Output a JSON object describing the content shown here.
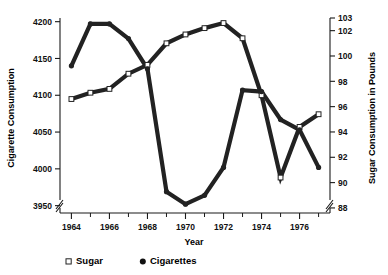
{
  "chart_data": {
    "type": "line",
    "title": "",
    "xlabel": "Year",
    "ylabel": "Cigarette Consumption",
    "ylabel_right": "Sugar Consumption in Pounds",
    "x": [
      1964,
      1965,
      1966,
      1967,
      1968,
      1969,
      1970,
      1971,
      1972,
      1973,
      1974,
      1975,
      1976,
      1977
    ],
    "xlim": [
      1963.4,
      1977.6
    ],
    "xticks_major": [
      1964,
      1966,
      1968,
      1970,
      1972,
      1974,
      1976
    ],
    "xticks_minor": [
      1965,
      1967,
      1969,
      1971,
      1973,
      1975,
      1977
    ],
    "xticklabels": [
      "1964",
      "1966",
      "1968",
      "1970",
      "1972",
      "1974",
      "1976"
    ],
    "ylim": [
      3940,
      4205
    ],
    "yticks": [
      3950,
      4000,
      4050,
      4100,
      4150,
      4200
    ],
    "yticklabels": [
      "3950",
      "4000",
      "4050",
      "4100",
      "4150",
      "4200"
    ],
    "ylim_right": [
      87.6,
      103.0
    ],
    "yticks_right": [
      88,
      90,
      92,
      94,
      96,
      98,
      100,
      102,
      103
    ],
    "yticklabels_right": [
      "88",
      "90",
      "92",
      "94",
      "96",
      "98",
      "100",
      "102",
      "103"
    ],
    "axis_break_left": true,
    "axis_break_right": true,
    "grid": false,
    "legend_position": "below-left",
    "series": [
      {
        "name": "Sugar",
        "axis": "right",
        "marker": "open-square",
        "legend_marker": "square-open",
        "values": [
          96.6,
          97.1,
          97.4,
          98.6,
          99.3,
          101.0,
          101.7,
          102.2,
          102.6,
          101.4,
          96.9,
          90.4,
          94.4,
          95.4
        ]
      },
      {
        "name": "Cigarettes",
        "axis": "left",
        "marker": "filled-circle",
        "legend_marker": "circle-filled",
        "values": [
          4140,
          4197,
          4197,
          4177,
          4136,
          3969,
          3952,
          3964,
          4002,
          4107,
          4105,
          4067,
          4053,
          4002
        ]
      }
    ]
  },
  "legend": {
    "items": [
      {
        "label": "Sugar",
        "marker": "square-open"
      },
      {
        "label": "Cigarettes",
        "marker": "circle-filled"
      }
    ]
  },
  "colors": {
    "line": "#222222",
    "axis": "#1a1a1a",
    "text": "#000000",
    "background": "#ffffff"
  }
}
